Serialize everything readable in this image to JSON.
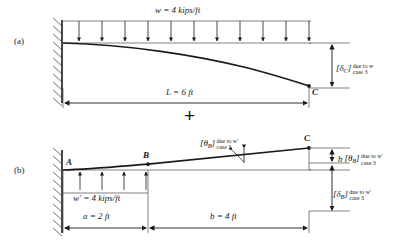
{
  "figure": {
    "operator": "+",
    "panels": [
      {
        "tag": "(a)",
        "load_label": "w = 4 kips/ft",
        "load_symbol": "w",
        "load_value": "4 kips/ft",
        "span_label": "L = 6 ft",
        "span_symbol": "L",
        "span_value": "6 ft",
        "support": "fixed-wall-hatched",
        "points": [
          {
            "name": "C",
            "label": "C"
          }
        ],
        "deflection": {
          "bracket": "[",
          "symbol": "δ",
          "subscript": "C",
          "bracket_close": "]",
          "sup_text": "due to w",
          "sub_text": "case 3"
        }
      },
      {
        "tag": "(b)",
        "load_label": "w' = 4 kips/ft",
        "load_symbol": "w'",
        "load_value": "4 kips/ft",
        "dim_a_label": "a  = 2 ft",
        "dim_a_symbol": "a",
        "dim_a_value": "2 ft",
        "dim_b_label": "b = 4 ft",
        "dim_b_symbol": "b",
        "dim_b_value": "4 ft",
        "support": "fixed-wall-hatched",
        "points": [
          {
            "name": "A",
            "label": "A"
          },
          {
            "name": "B",
            "label": "B"
          },
          {
            "name": "C",
            "label": "C"
          }
        ],
        "slope_callout": {
          "bracket": "[",
          "symbol": "θ",
          "subscript": "B",
          "bracket_close": "]",
          "sup_text": "due to w'",
          "sub_text": "case 3"
        },
        "slope_times_b": {
          "lead": "b",
          "bracket": "[",
          "symbol": "θ",
          "subscript": "B",
          "bracket_close": "]",
          "sup_text": "due to w'",
          "sub_text": "case 3"
        },
        "deflection": {
          "bracket": "[",
          "symbol": "δ",
          "subscript": "B",
          "bracket_close": "]",
          "sup_text": "due to w'",
          "sub_text": "case 3"
        }
      }
    ]
  },
  "colors": {
    "ink": "#1a1a1a",
    "thin_line": "#4a4a4a",
    "background": "#ffffff"
  }
}
